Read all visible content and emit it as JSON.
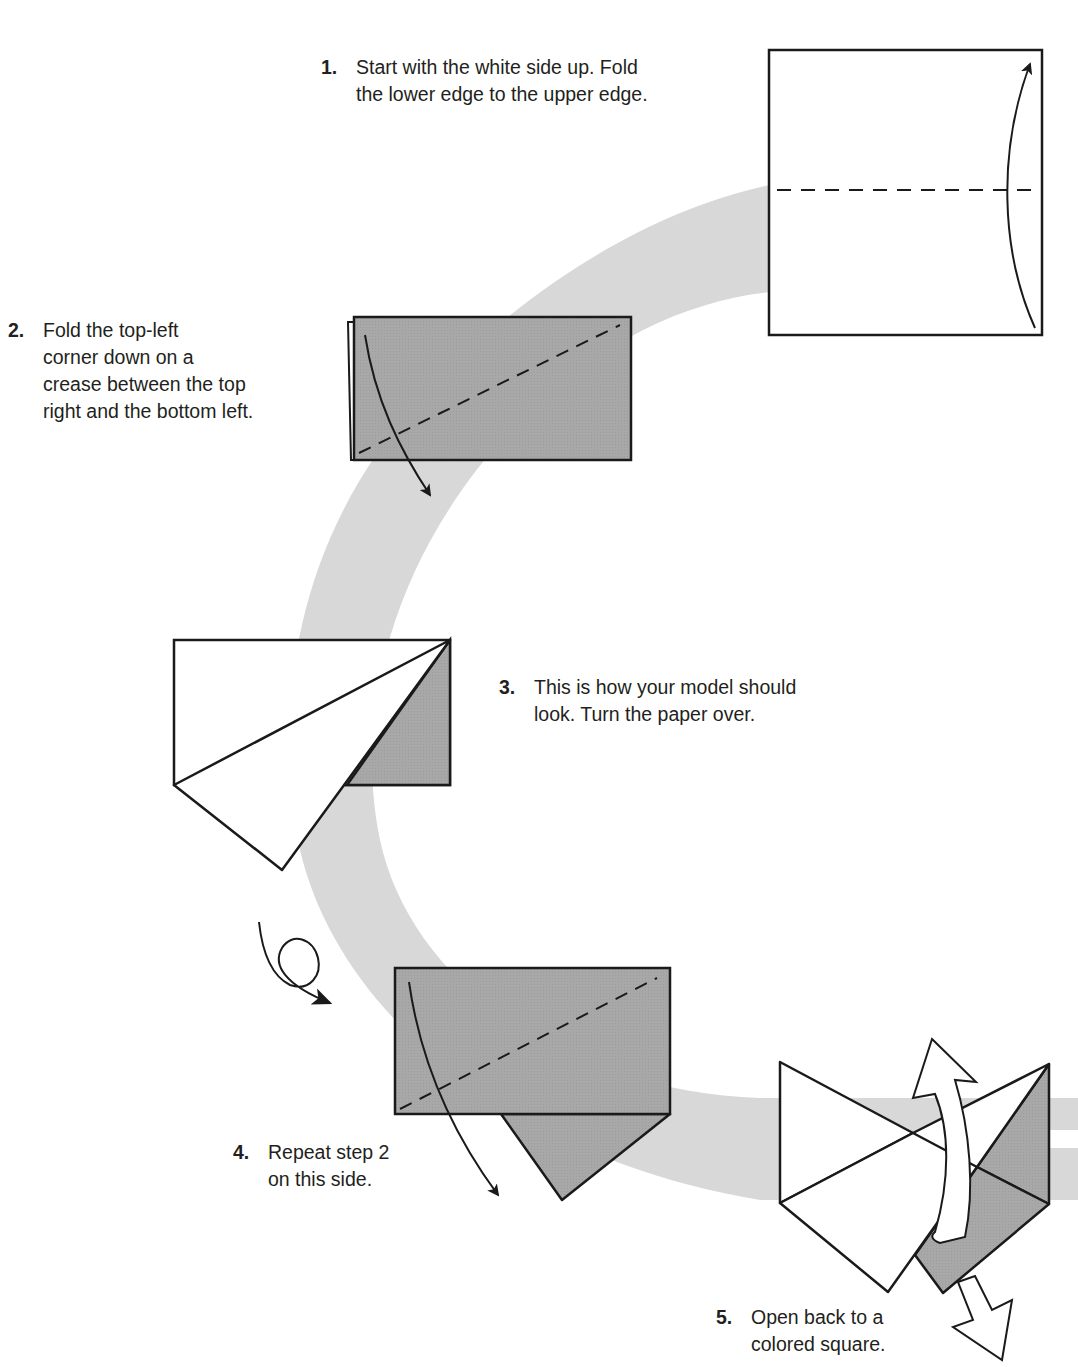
{
  "colors": {
    "swoosh": "#d6d6d6",
    "paper_colored": "#a6a6a6",
    "paper_white": "#ffffff",
    "line": "#1a1a1a"
  },
  "steps": [
    {
      "number": "1.",
      "text": "Start with the white side up. Fold\nthe lower edge to the upper edge."
    },
    {
      "number": "2.",
      "text": "Fold the top-left\ncorner down on a\ncrease between the top\nright and the bottom left."
    },
    {
      "number": "3.",
      "text": "This is how your model should\nlook. Turn the paper over."
    },
    {
      "number": "4.",
      "text": "Repeat step 2\non this side."
    },
    {
      "number": "5.",
      "text": "Open back to a\ncolored square."
    }
  ],
  "icons": {
    "fold_arrow": "curved-arrow",
    "turn_over": "loop-arrow",
    "unfold": "hollow-arrow",
    "crease": "dashed-line"
  }
}
